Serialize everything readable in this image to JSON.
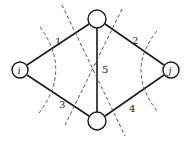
{
  "diagram": {
    "type": "network cut-set diagram",
    "nodes": [
      {
        "id": "i",
        "label": "i",
        "cx": 20,
        "cy": 70,
        "r": 8
      },
      {
        "id": "top",
        "label": "",
        "cx": 97,
        "cy": 19,
        "r": 9
      },
      {
        "id": "bottom",
        "label": "",
        "cx": 97,
        "cy": 121,
        "r": 9
      },
      {
        "id": "j",
        "label": "j",
        "cx": 171,
        "cy": 70,
        "r": 8
      }
    ],
    "edges": [
      {
        "label": "1",
        "from": "i",
        "to": "top"
      },
      {
        "label": "2",
        "from": "top",
        "to": "j"
      },
      {
        "label": "3",
        "from": "i",
        "to": "bottom"
      },
      {
        "label": "4",
        "from": "bottom",
        "to": "j"
      },
      {
        "label": "5",
        "from": "top",
        "to": "bottom"
      }
    ],
    "cuts": [
      {
        "name": "cut-around-i",
        "edges": [
          "1",
          "3"
        ]
      },
      {
        "name": "cut-around-j",
        "edges": [
          "2",
          "4"
        ]
      },
      {
        "name": "cut-diagonal-1",
        "edges": [
          "1",
          "5",
          "4"
        ]
      },
      {
        "name": "cut-diagonal-2",
        "edges": [
          "2",
          "5",
          "3"
        ]
      }
    ]
  }
}
